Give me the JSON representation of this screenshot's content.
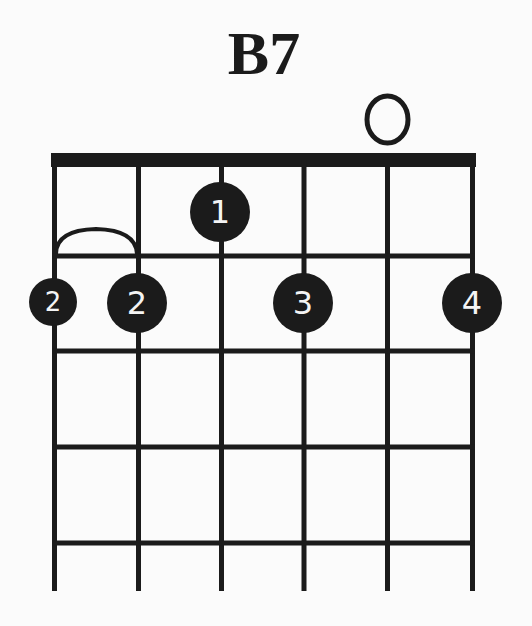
{
  "chord": {
    "name": "B7",
    "instrument": "guitar",
    "num_strings": 6,
    "num_frets_shown": 4,
    "string_markers": [
      {
        "string": 5,
        "marker": "O",
        "meaning": "open"
      }
    ],
    "fingers": [
      {
        "string": 3,
        "fret": 1,
        "finger": "1"
      },
      {
        "string": 1,
        "fret": 2,
        "finger": "2",
        "size": "small"
      },
      {
        "string": 2,
        "fret": 2,
        "finger": "2"
      },
      {
        "string": 4,
        "fret": 2,
        "finger": "3"
      },
      {
        "string": 6,
        "fret": 2,
        "finger": "4"
      }
    ],
    "barre": {
      "from_string": 1,
      "to_string": 2,
      "fret": 2,
      "finger": "2",
      "shape": "arc"
    }
  },
  "labels": {
    "title": "B7",
    "open_marker": "O",
    "finger_1": "1",
    "finger_2a": "2",
    "finger_2b": "2",
    "finger_3": "3",
    "finger_4": "4"
  },
  "colors": {
    "background": "#fbfbfb",
    "ink": "#1b1b1b",
    "finger_text": "#f4f4f4"
  }
}
